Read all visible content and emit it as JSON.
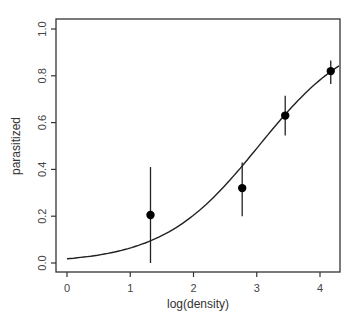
{
  "chart_data": {
    "type": "scatter",
    "title": "",
    "xlabel": "log(density)",
    "ylabel": "parasitized",
    "xlim": [
      -0.2,
      4.3
    ],
    "ylim": [
      -0.04,
      1.04
    ],
    "grid": false,
    "legend": null,
    "x_ticks": [
      0,
      1,
      2,
      3,
      4
    ],
    "x_tick_labels": [
      "0",
      "1",
      "2",
      "3",
      "4"
    ],
    "y_ticks": [
      0.0,
      0.2,
      0.4,
      0.6,
      0.8,
      1.0
    ],
    "y_tick_labels": [
      "0.0",
      "0.2",
      "0.4",
      "0.6",
      "0.8",
      "1.0"
    ],
    "series": [
      {
        "name": "observed",
        "type": "scatter",
        "points": [
          {
            "x": 1.32,
            "y": 0.205,
            "lower": 0.0,
            "upper": 0.41
          },
          {
            "x": 2.77,
            "y": 0.32,
            "lower": 0.2,
            "upper": 0.43
          },
          {
            "x": 3.45,
            "y": 0.63,
            "lower": 0.545,
            "upper": 0.715
          },
          {
            "x": 4.17,
            "y": 0.82,
            "lower": 0.765,
            "upper": 0.865
          }
        ]
      },
      {
        "name": "logistic fit",
        "type": "line",
        "intercept": -4.0,
        "slope": 1.32,
        "x_range": [
          0,
          4.3
        ]
      }
    ]
  }
}
